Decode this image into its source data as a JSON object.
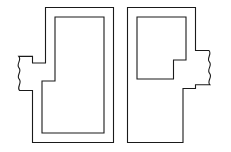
{
  "figure": {
    "title": "Two interlocking S-shaped jigsaw puzzle pieces",
    "background_color": "#ffffff",
    "stroke_color": "#1a1a1a",
    "stroke_width": 1.1,
    "canvas": {
      "width": 231,
      "height": 152
    },
    "shapes": [
      {
        "name": "left-puzzle-piece",
        "label": "Left S-shaped piece with wavy tab on the left edge",
        "outer_path": "M 45.5 7.5 L 113.5 7.5 L 113.5 142.5 L 32.5 142.5 L 32.5 90.5 L 19.5 90.5 C 16.2 86.8 22.6 83.0 19.2 79.2 C 15.8 75.4 22.4 71.6 19.0 67.8 C 15.6 64.0 22.2 60.2 18.8 56.4 L 32.5 56.4 L 32.5 63.0 L 45.5 63.0 Z",
        "inner_path": "M 55.0 17.0 L 104.0 17.0 L 104.0 133.0 L 42.0 133.0 L 42.0 81.0 L 55.0 81.0 Z",
        "tab_side": "left",
        "tab_style": "wavy"
      },
      {
        "name": "right-puzzle-piece",
        "label": "Right S-shaped piece with wavy tab on the right edge",
        "outer_path": "M 127.5 7.5 L 195.5 7.5 L 195.5 50.5 L 209.0 50.5 C 212.4 54.3 206.0 58.1 209.4 61.9 C 212.8 65.7 206.2 69.5 209.6 73.3 C 213.0 77.1 206.4 80.9 209.8 84.7 L 195.5 84.7 L 195.5 88.5 L 183.0 88.5 L 183.0 142.5 L 127.5 142.5 Z",
        "inner_path": "M 137.0 17.0 L 186.0 17.0 L 186.0 60.0 L 173.5 60.0 L 173.5 79.0 L 137.0 79.0 Z",
        "tab_side": "right",
        "tab_style": "wavy"
      }
    ],
    "seam": {
      "name": "center-seam",
      "label": "Vertical gap separating the two interlocked pieces",
      "x_range": [
        113.5,
        127.5
      ]
    }
  }
}
